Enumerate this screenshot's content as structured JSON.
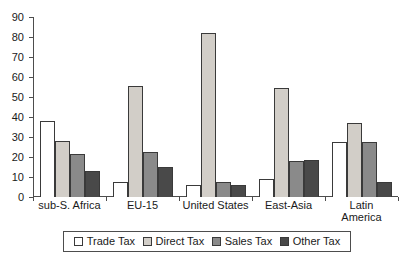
{
  "chart_data": {
    "type": "bar",
    "title": "",
    "subtitle": "",
    "xlabel": "",
    "ylabel": "",
    "ylim": [
      0,
      90
    ],
    "yticks": [
      0,
      10,
      20,
      30,
      40,
      50,
      60,
      70,
      80,
      90
    ],
    "grid": false,
    "legend_position": "bottom",
    "categories": [
      "sub-S. Africa",
      "EU-15",
      "United States",
      "East-Asia",
      "Latin\nAmerica"
    ],
    "series": [
      {
        "name": "Trade Tax",
        "color": "#ffffff",
        "values": [
          38,
          7.5,
          6,
          9,
          27.5
        ]
      },
      {
        "name": "Direct Tax",
        "color": "#d2cec8",
        "values": [
          28,
          55.5,
          82,
          54.5,
          37
        ]
      },
      {
        "name": "Sales Tax",
        "color": "#8a8a8a",
        "values": [
          21.5,
          22.5,
          7.5,
          18,
          27.5
        ]
      },
      {
        "name": "Other Tax",
        "color": "#494949",
        "values": [
          13,
          15,
          6,
          18.5,
          7.5
        ]
      }
    ]
  },
  "legend": {
    "items": [
      {
        "label": "Trade Tax",
        "swatch_class": "sw-trade"
      },
      {
        "label": "Direct Tax",
        "swatch_class": "sw-direct"
      },
      {
        "label": "Sales Tax",
        "swatch_class": "sw-sales"
      },
      {
        "label": "Other Tax",
        "swatch_class": "sw-other"
      }
    ]
  }
}
